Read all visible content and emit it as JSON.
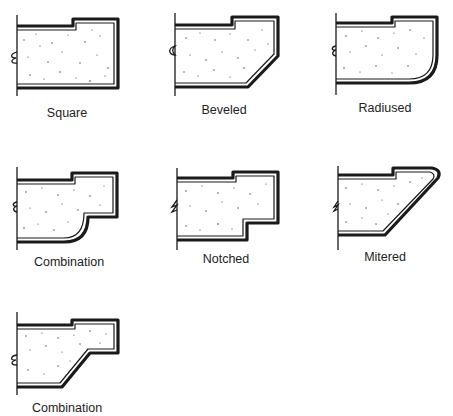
{
  "diagram": {
    "title": "",
    "profiles": [
      {
        "name": "Square",
        "label_x": 67,
        "label_y": 117
      },
      {
        "name": "Beveled",
        "label_x": 224,
        "label_y": 114
      },
      {
        "name": "Radiused",
        "label_x": 385,
        "label_y": 112
      },
      {
        "name": "Combination",
        "label_x": 69,
        "label_y": 266
      },
      {
        "name": "Notched",
        "label_x": 226,
        "label_y": 263
      },
      {
        "name": "Mitered",
        "label_x": 385,
        "label_y": 261
      },
      {
        "name": "Combination",
        "label_x": 67,
        "label_y": 412
      }
    ]
  },
  "colors": {
    "line": "#1a1a1a",
    "background": "#ffffff",
    "stipple": "#333333"
  }
}
